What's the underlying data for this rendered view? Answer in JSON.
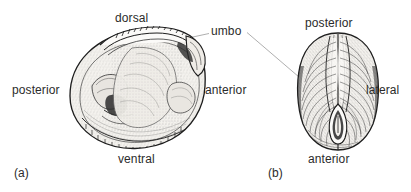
{
  "figure": {
    "background_color": "#ffffff",
    "text_color": "#2b2b2b",
    "leader_line_color": "#9a9a9a"
  },
  "panels": [
    {
      "id": "(a)",
      "view": "interior-lateral-view",
      "labels": [
        {
          "name": "dorsal",
          "text": "dorsal"
        },
        {
          "name": "posterior",
          "text": "posterior"
        },
        {
          "name": "anterior",
          "text": "anterior"
        },
        {
          "name": "ventral",
          "text": "ventral"
        }
      ]
    },
    {
      "id": "(b)",
      "view": "dorsal-view",
      "labels": [
        {
          "name": "posterior",
          "text": "posterior"
        },
        {
          "name": "lateral",
          "text": "lateral"
        },
        {
          "name": "anterior",
          "text": "anterior"
        }
      ]
    }
  ],
  "callout": {
    "name": "umbo",
    "text": "umbo"
  }
}
